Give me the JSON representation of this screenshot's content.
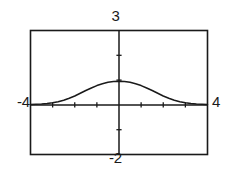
{
  "screen": {
    "title": "graphing-calculator-plot",
    "background_color": "#ffffff",
    "ink_color": "#1a1a1a"
  },
  "window_labels": {
    "ymax": "3",
    "ymin": "-2",
    "xmin": "-4",
    "xmax": "4"
  },
  "chart_data": {
    "type": "line",
    "title": "",
    "xlabel": "",
    "ylabel": "",
    "xlim": [
      -4,
      4
    ],
    "ylim": [
      -2,
      3
    ],
    "grid": false,
    "legend": false,
    "legend_position": "none",
    "axes": {
      "x_axis_at_y": 0,
      "y_axis_at_x": 0,
      "x_tick_spacing": 1,
      "y_tick_spacing": 1,
      "x_ticks": [
        -3,
        -2,
        -1,
        1,
        2,
        3
      ],
      "y_ticks": [
        -1,
        1,
        2
      ]
    },
    "annotations": [
      "curve peaks on the y-axis just above the x-axis",
      "curve flattens toward both left and right window edges"
    ],
    "series": [
      {
        "name": "curve",
        "color": "#1a1a1a",
        "x": [
          -4.0,
          -3.75,
          -3.5,
          -3.25,
          -3.0,
          -2.75,
          -2.5,
          -2.25,
          -2.0,
          -1.75,
          -1.5,
          -1.25,
          -1.0,
          -0.75,
          -0.5,
          -0.25,
          0.0,
          0.25,
          0.5,
          0.75,
          1.0,
          1.25,
          1.5,
          1.75,
          2.0,
          2.25,
          2.5,
          2.75,
          3.0,
          3.25,
          3.5,
          3.75,
          4.0
        ],
        "y": [
          0.02,
          0.03,
          0.04,
          0.06,
          0.09,
          0.13,
          0.19,
          0.27,
          0.36,
          0.47,
          0.58,
          0.68,
          0.78,
          0.85,
          0.91,
          0.94,
          0.95,
          0.94,
          0.91,
          0.85,
          0.78,
          0.68,
          0.58,
          0.47,
          0.36,
          0.27,
          0.19,
          0.13,
          0.09,
          0.06,
          0.04,
          0.03,
          0.02
        ]
      }
    ]
  }
}
